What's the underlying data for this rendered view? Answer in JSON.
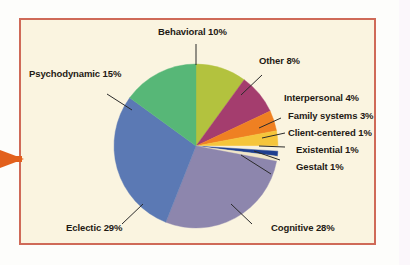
{
  "figure": {
    "frame_color": "#cf6a58",
    "background_color": "#faf4e0",
    "margin_marker": "orange-arrow"
  },
  "chart_data": {
    "type": "pie",
    "title": "",
    "xlabel": "",
    "ylabel": "",
    "legend_position": "none",
    "grid": false,
    "units": "percent",
    "start_angle_deg": 0,
    "direction": "clockwise",
    "categories": [
      "Behavioral",
      "Other",
      "Interpersonal",
      "Family systems",
      "Client-centered",
      "Existential",
      "Gestalt",
      "Cognitive",
      "Eclectic",
      "Psychodynamic"
    ],
    "values": [
      10,
      8,
      4,
      3,
      1,
      1,
      1,
      28,
      29,
      15
    ],
    "colors": [
      "#b3c23e",
      "#a43d6e",
      "#ef8022",
      "#f5c53b",
      "#f7f1dd",
      "#1f3f8f",
      "#f0e6c8",
      "#8d86ad",
      "#5b79b4",
      "#57b777"
    ],
    "labels": [
      "Behavioral 10%",
      "Other 8%",
      "Interpersonal 4%",
      "Family systems 3%",
      "Client-centered 1%",
      "Existential 1%",
      "Gestalt 1%",
      "Cognitive 28%",
      "Eclectic 29%",
      "Psychodynamic 15%"
    ]
  },
  "slice_labels": {
    "behavioral": "Behavioral 10%",
    "other": "Other 8%",
    "interpersonal": "Interpersonal 4%",
    "family_systems": "Family systems 3%",
    "client_centered": "Client-centered 1%",
    "existential": "Existential 1%",
    "gestalt": "Gestalt 1%",
    "cognitive": "Cognitive 28%",
    "eclectic": "Eclectic 29%",
    "psychodynamic": "Psychodynamic 15%"
  }
}
